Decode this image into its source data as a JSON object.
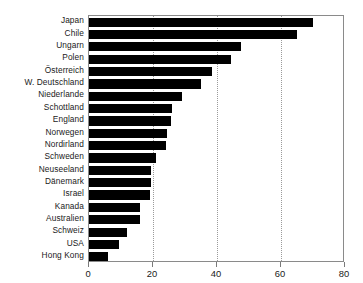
{
  "chart_data": {
    "type": "bar",
    "orientation": "horizontal",
    "title": "",
    "subtitle": "",
    "xlabel": "",
    "ylabel": "",
    "xlim": [
      0,
      80
    ],
    "xticks": [
      0,
      20,
      40,
      60,
      80
    ],
    "xtick_labels": [
      "0",
      "20",
      "40",
      "60",
      "80"
    ],
    "gridlines": {
      "x": [
        20,
        40,
        60
      ],
      "style": "dotted",
      "visible": true
    },
    "legend": {
      "visible": false,
      "entries": []
    },
    "bar_color": "#000000",
    "background_color": "#ffffff",
    "axis_color": "#8a8a8a",
    "categories": [
      "Japan",
      "Chile",
      "Ungarn",
      "Polen",
      "Österreich",
      "W. Deutschland",
      "Niederlande",
      "Schottland",
      "England",
      "Norwegen",
      "Nordirland",
      "Schweden",
      "Neuseeland",
      "Dänemark",
      "Israel",
      "Kanada",
      "Australien",
      "Schweiz",
      "USA",
      "Hong Kong"
    ],
    "values": [
      70,
      65,
      47.5,
      44.5,
      38.5,
      35,
      29,
      26,
      25.5,
      24.5,
      24,
      21,
      19.5,
      19.3,
      19,
      16,
      16,
      12,
      9.5,
      6
    ]
  }
}
